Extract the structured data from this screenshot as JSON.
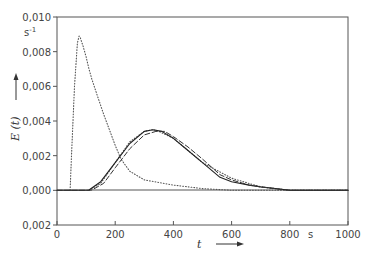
{
  "chart_data": {
    "type": "line",
    "title": "",
    "xlabel": "t",
    "xunit": "s",
    "ylabel": "E(t)",
    "yunit": "s-1",
    "xlim": [
      0,
      1000
    ],
    "ylim": [
      -0.002,
      0.01
    ],
    "xticks": [
      "0",
      "200",
      "400",
      "600",
      "800",
      "1000"
    ],
    "yticks": [
      "0,010",
      "0,008",
      "0,006",
      "0,004",
      "0,002",
      "0,000",
      "0,002"
    ],
    "grid": false,
    "legend": null,
    "series": [
      {
        "name": "early-response (dotted)",
        "style": "dotted",
        "x": [
          45,
          50,
          60,
          70,
          76,
          80,
          90,
          100,
          110,
          120,
          140,
          160,
          180,
          200,
          220,
          250,
          300,
          400,
          500,
          600,
          800,
          1000
        ],
        "y": [
          0.0,
          0.002,
          0.006,
          0.0085,
          0.0089,
          0.0088,
          0.0083,
          0.0077,
          0.007,
          0.0064,
          0.0054,
          0.0044,
          0.0035,
          0.0026,
          0.0018,
          0.0011,
          0.0006,
          0.0003,
          0.0001,
          0.0,
          0.0,
          0.0
        ]
      },
      {
        "name": "measured (dotted, near model)",
        "style": "dotted",
        "x": [
          110,
          150,
          200,
          250,
          300,
          330,
          350,
          400,
          450,
          500,
          600,
          700,
          800,
          1000
        ],
        "y": [
          0.0,
          0.0004,
          0.0016,
          0.0028,
          0.0034,
          0.0035,
          0.0034,
          0.003,
          0.0023,
          0.0016,
          0.0007,
          0.0002,
          0.0,
          0.0
        ]
      },
      {
        "name": "model (solid)",
        "style": "solid",
        "x": [
          0,
          100,
          110,
          150,
          200,
          250,
          300,
          330,
          360,
          400,
          450,
          500,
          560,
          600,
          660,
          700,
          800,
          1000
        ],
        "y": [
          0.0,
          0.0,
          2e-05,
          0.0005,
          0.0016,
          0.0027,
          0.0034,
          0.0035,
          0.0034,
          0.003,
          0.0023,
          0.0016,
          0.00075,
          0.0005,
          0.0003,
          0.0002,
          0.0,
          0.0
        ]
      },
      {
        "name": "model (dashed)",
        "style": "dashed",
        "x": [
          0,
          110,
          120,
          160,
          200,
          250,
          300,
          340,
          370,
          400,
          450,
          500,
          560,
          600,
          660,
          700,
          800,
          1000
        ],
        "y": [
          0.0,
          0.0,
          2e-05,
          0.0004,
          0.0013,
          0.0024,
          0.0032,
          0.0034,
          0.0034,
          0.0031,
          0.0025,
          0.0018,
          0.0009,
          0.0006,
          0.0003,
          0.0002,
          0.0,
          0.0
        ]
      }
    ]
  },
  "labels": {
    "y_axis": "E (t)",
    "y_unit": "s",
    "y_unit_exp": "-1",
    "x_axis": "t",
    "x_unit": "s"
  }
}
